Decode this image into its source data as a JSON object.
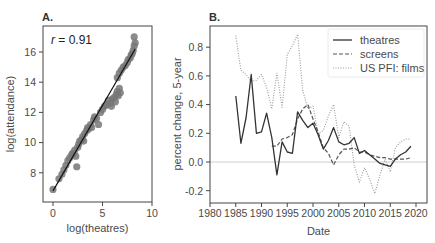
{
  "chart_data": [
    {
      "panel": "A.",
      "type": "scatter",
      "title": "A.",
      "xlabel": "log(theatres)",
      "ylabel": "log(attendance)",
      "xlim": [
        -1,
        10
      ],
      "ylim": [
        6.2,
        17.7
      ],
      "xticks": [
        0,
        5,
        10
      ],
      "yticks": [
        8,
        10,
        12,
        14,
        16
      ],
      "annotation": "r = 0.91",
      "annotation_r": "r",
      "annotation_value": " = 0.91",
      "grid": false,
      "fit_line": {
        "x": [
          0,
          8.3
        ],
        "y": [
          6.8,
          16.2
        ]
      },
      "points": [
        [
          0.0,
          6.9
        ],
        [
          0.6,
          7.6
        ],
        [
          0.9,
          7.9
        ],
        [
          1.1,
          8.2
        ],
        [
          1.3,
          8.5
        ],
        [
          1.5,
          8.8
        ],
        [
          1.7,
          9.0
        ],
        [
          1.9,
          9.2
        ],
        [
          2.0,
          9.3
        ],
        [
          2.2,
          9.5
        ],
        [
          2.3,
          9.1
        ],
        [
          2.4,
          8.4
        ],
        [
          2.5,
          9.7
        ],
        [
          2.6,
          9.9
        ],
        [
          2.7,
          10.1
        ],
        [
          2.9,
          10.2
        ],
        [
          3.0,
          10.4
        ],
        [
          3.1,
          10.1
        ],
        [
          3.2,
          10.6
        ],
        [
          3.4,
          10.8
        ],
        [
          3.5,
          11.0
        ],
        [
          3.6,
          10.9
        ],
        [
          3.8,
          11.2
        ],
        [
          3.9,
          11.0
        ],
        [
          4.1,
          11.5
        ],
        [
          4.2,
          11.7
        ],
        [
          4.4,
          11.6
        ],
        [
          4.6,
          11.2
        ],
        [
          4.8,
          12.0
        ],
        [
          5.0,
          12.2
        ],
        [
          5.2,
          12.4
        ],
        [
          5.4,
          12.5
        ],
        [
          5.6,
          12.8
        ],
        [
          5.8,
          12.6
        ],
        [
          5.9,
          12.4
        ],
        [
          6.0,
          12.9
        ],
        [
          6.2,
          13.0
        ],
        [
          6.3,
          12.7
        ],
        [
          6.4,
          13.2
        ],
        [
          6.5,
          13.4
        ],
        [
          6.6,
          13.1
        ],
        [
          6.7,
          13.6
        ],
        [
          6.8,
          13.3
        ],
        [
          6.5,
          14.3
        ],
        [
          6.7,
          14.6
        ],
        [
          6.9,
          14.8
        ],
        [
          7.1,
          15.0
        ],
        [
          7.3,
          15.1
        ],
        [
          7.5,
          15.3
        ],
        [
          7.6,
          15.5
        ],
        [
          7.8,
          15.6
        ],
        [
          7.9,
          15.8
        ],
        [
          8.0,
          15.9
        ],
        [
          8.1,
          16.1
        ],
        [
          8.2,
          16.4
        ],
        [
          8.3,
          16.6
        ],
        [
          8.2,
          17.0
        ]
      ],
      "point_color": "#777777",
      "line_color": "#111111"
    },
    {
      "panel": "B.",
      "type": "line",
      "title": "B.",
      "xlabel": "Date",
      "ylabel": "percent change, 5-year",
      "xlim": [
        1980,
        2022
      ],
      "ylim": [
        -0.28,
        0.95
      ],
      "xticks": [
        1980,
        1985,
        1990,
        1995,
        2000,
        2005,
        2010,
        2015,
        2020
      ],
      "yticks": [
        -0.2,
        0.0,
        0.2,
        0.4,
        0.6,
        0.8
      ],
      "ytick_labels": [
        "-0.2",
        "0.0",
        "0.2",
        "0.4",
        "0.6",
        "0.8"
      ],
      "hline": 0.0,
      "grid": false,
      "legend_position": "upper right",
      "series": [
        {
          "name": "theatres",
          "style": "solid",
          "color": "#333333",
          "x": [
            1985,
            1986,
            1987,
            1988,
            1989,
            1990,
            1991,
            1992,
            1993,
            1994,
            1995,
            1996,
            1997,
            1998,
            1999,
            2000,
            2001,
            2002,
            2003,
            2004,
            2005,
            2006,
            2007,
            2008,
            2009,
            2010,
            2011,
            2012,
            2013,
            2014,
            2015,
            2016,
            2017,
            2018,
            2019
          ],
          "values": [
            0.46,
            0.13,
            0.31,
            0.61,
            0.2,
            0.21,
            0.34,
            0.17,
            -0.09,
            0.14,
            0.07,
            0.06,
            0.35,
            0.29,
            0.24,
            0.27,
            0.19,
            0.09,
            0.15,
            0.24,
            0.14,
            0.12,
            0.13,
            0.17,
            0.06,
            0.08,
            0.05,
            0.02,
            -0.01,
            -0.02,
            -0.03,
            0.02,
            0.05,
            0.07,
            0.11
          ]
        },
        {
          "name": "screens",
          "style": "dashed",
          "color": "#555555",
          "x": [
            1992,
            1993,
            1994,
            1995,
            1996,
            1997,
            1998,
            1999,
            2000,
            2001,
            2002,
            2003,
            2004,
            2005,
            2006,
            2007,
            2008,
            2009,
            2010,
            2011,
            2012,
            2013,
            2014,
            2015,
            2016,
            2017,
            2018,
            2019
          ],
          "values": [
            0.11,
            0.11,
            0.16,
            0.17,
            0.19,
            0.3,
            0.37,
            0.4,
            0.3,
            0.21,
            0.1,
            0.06,
            -0.02,
            0.05,
            0.09,
            0.09,
            0.1,
            0.07,
            0.07,
            0.05,
            0.04,
            0.03,
            0.03,
            0.02,
            0.02,
            0.02,
            0.02,
            0.03
          ]
        },
        {
          "name": "US PFI: films",
          "style": "dotted",
          "color": "#999999",
          "x": [
            1985,
            1986,
            1987,
            1988,
            1989,
            1990,
            1991,
            1992,
            1993,
            1994,
            1995,
            1996,
            1997,
            1998,
            1999,
            2000,
            2001,
            2002,
            2003,
            2004,
            2005,
            2006,
            2007,
            2008,
            2009,
            2010,
            2011,
            2012,
            2013,
            2014,
            2015,
            2016,
            2017,
            2018,
            2019
          ],
          "values": [
            0.88,
            0.64,
            0.61,
            0.56,
            0.57,
            0.61,
            0.52,
            0.37,
            0.62,
            0.38,
            0.75,
            0.81,
            0.89,
            0.5,
            0.37,
            0.39,
            0.2,
            0.22,
            0.32,
            0.4,
            0.17,
            0.28,
            0.25,
            -0.02,
            -0.14,
            -0.04,
            -0.12,
            -0.22,
            -0.09,
            0.02,
            -0.07,
            0.1,
            0.14,
            0.16,
            0.16
          ]
        }
      ]
    }
  ],
  "legend": {
    "items": [
      "theatres",
      "screens",
      "US PFI: films"
    ]
  }
}
